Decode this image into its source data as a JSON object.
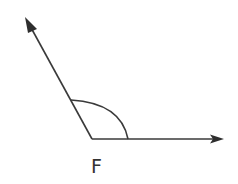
{
  "diagram": {
    "type": "angle",
    "vertex_label": "F",
    "angle_classification": "obtuse",
    "rays": [
      {
        "name": "upper-left-ray",
        "direction": "up-left"
      },
      {
        "name": "horizontal-ray",
        "direction": "right"
      }
    ],
    "arc_marker": true,
    "colors": {
      "stroke": "#3a3a3a",
      "background": "#ffffff"
    }
  }
}
